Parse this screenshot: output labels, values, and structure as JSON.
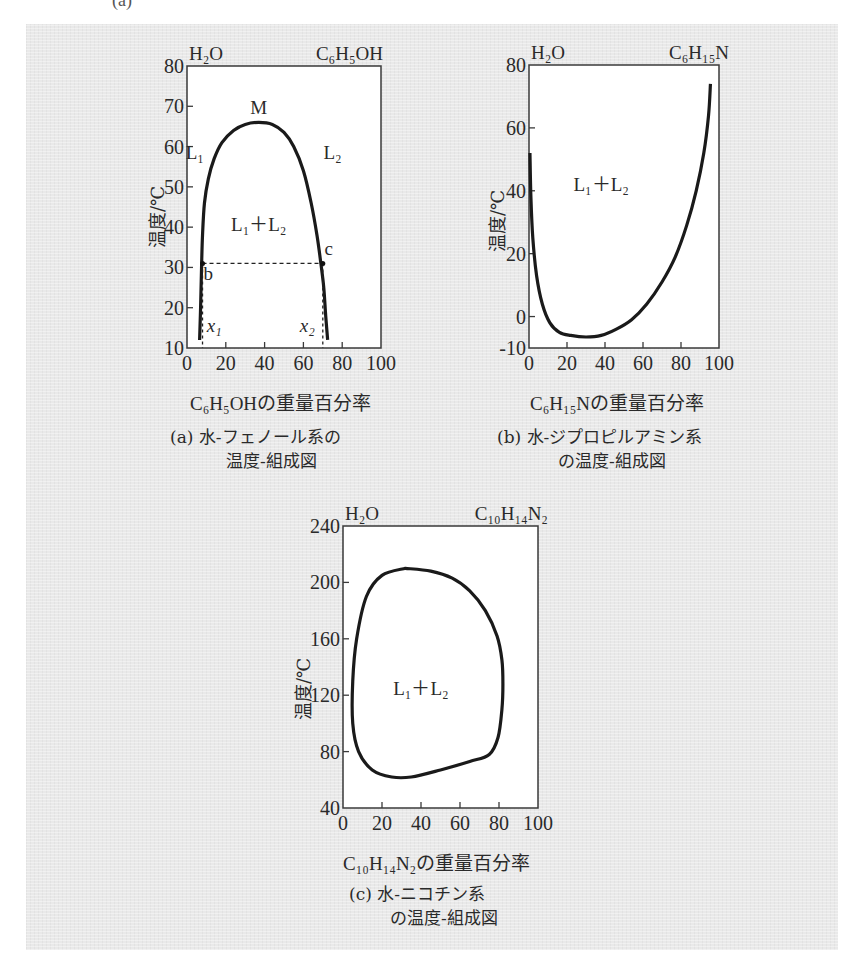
{
  "page": {
    "top_cutoff_label": "(a)"
  },
  "chart_data": [
    {
      "id": "a",
      "type": "line",
      "title": "(a) 水-フェノール系の温度-組成図",
      "caption_line1": "(a)  水-フェノール系の",
      "caption_line2": "温度-組成図",
      "left_component": "H₂O",
      "right_component": "C₆H₅OH",
      "xlabel": "C₆H₅OHの重量百分率",
      "ylabel": "温度/℃",
      "xlim": [
        0,
        100
      ],
      "ylim": [
        10,
        80
      ],
      "xticks": [
        0,
        20,
        40,
        60,
        80,
        100
      ],
      "yticks": [
        10,
        20,
        30,
        40,
        50,
        60,
        70,
        80
      ],
      "grid": false,
      "region_label": "L₁＋L₂",
      "annotations": [
        {
          "text": "M",
          "x": 37,
          "y": 68,
          "note": "critical point (max)"
        },
        {
          "text": "L₁",
          "x": 4,
          "y": 57
        },
        {
          "text": "L₂",
          "x": 75,
          "y": 57
        },
        {
          "text": "b",
          "x": 11,
          "y": 27
        },
        {
          "text": "c",
          "x": 73,
          "y": 33
        },
        {
          "text": "x₁",
          "x": 14,
          "y": 14
        },
        {
          "text": "x₂",
          "x": 62,
          "y": 14
        }
      ],
      "series": [
        {
          "name": "coexistence curve",
          "x": [
            6.5,
            7,
            7.5,
            8,
            9,
            11,
            14,
            18,
            24,
            30,
            37,
            44,
            50,
            55,
            60,
            64,
            67,
            69,
            70.5,
            71.5,
            72.5
          ],
          "y": [
            12,
            20,
            30,
            38,
            46,
            52,
            57,
            61,
            64,
            65.5,
            66,
            65.5,
            63.5,
            60,
            54,
            46,
            38,
            31,
            25,
            18,
            12
          ]
        }
      ],
      "tie_line": {
        "y": 31,
        "x_start": 8,
        "x_end": 70,
        "style": "dashed"
      },
      "drop_lines": [
        {
          "label": "x₁",
          "x": 8,
          "y_from": 31,
          "y_to": 10,
          "style": "dashed"
        },
        {
          "label": "x₂",
          "x": 70,
          "y_from": 31,
          "y_to": 10,
          "style": "dashed"
        }
      ]
    },
    {
      "id": "b",
      "type": "line",
      "title": "(b) 水-ジプロピルアミン系の温度-組成図",
      "caption_line1": "(b)  水-ジプロピルアミン系",
      "caption_line2": "の温度-組成図",
      "left_component": "H₂O",
      "right_component": "C₆H₁₅N",
      "xlabel": "C₆H₁₅Nの重量百分率",
      "ylabel": "温度/℃",
      "xlim": [
        0,
        100
      ],
      "ylim": [
        -10,
        80
      ],
      "xticks": [
        0,
        20,
        40,
        60,
        80,
        100
      ],
      "yticks": [
        -10,
        0,
        20,
        40,
        60,
        80
      ],
      "grid": false,
      "region_label": "L₁＋L₂",
      "series": [
        {
          "name": "coexistence curve",
          "x": [
            0.5,
            1,
            2,
            4,
            7,
            11,
            16,
            22,
            30,
            38,
            46,
            54,
            62,
            70,
            77,
            83,
            88,
            92,
            94.5,
            95.5
          ],
          "y": [
            52,
            38,
            25,
            13,
            4,
            -2,
            -5,
            -6,
            -6.5,
            -6,
            -4,
            -1,
            4,
            11,
            19,
            29,
            40,
            52,
            64,
            74
          ]
        }
      ]
    },
    {
      "id": "c",
      "type": "line",
      "title": "(c) 水-ニコチン系の温度-組成図",
      "caption_line1": "(c)  水-ニコチン系",
      "caption_line2": "の温度-組成図",
      "left_component": "H₂O",
      "right_component": "C₁₀H₁₄N₂",
      "xlabel": "C₁₀H₁₄N₂の重量百分率",
      "ylabel": "温度/℃",
      "xlim": [
        0,
        100
      ],
      "ylim": [
        40,
        240
      ],
      "xticks": [
        0,
        20,
        40,
        60,
        80,
        100
      ],
      "yticks": [
        40,
        80,
        120,
        160,
        200,
        240
      ],
      "grid": false,
      "region_label": "L₁＋L₂",
      "series": [
        {
          "name": "closed-loop coexistence curve",
          "closed": true,
          "x": [
            32,
            45,
            56,
            65,
            73,
            79,
            81.5,
            82,
            81.5,
            79.5,
            75,
            65,
            50,
            35,
            25,
            15,
            8,
            5,
            5,
            7,
            12,
            20,
            32
          ],
          "y": [
            210,
            208,
            203,
            194,
            180,
            162,
            145,
            128,
            110,
            90,
            78,
            73,
            67,
            62,
            62,
            67,
            80,
            100,
            130,
            160,
            190,
            205,
            210
          ]
        }
      ]
    }
  ]
}
